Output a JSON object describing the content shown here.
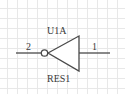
{
  "schematic": {
    "component": {
      "designator": "U1A",
      "value": "RES1",
      "type": "inverter",
      "input_pin": "2",
      "output_pin": "1"
    },
    "colors": {
      "wire": "#4a4a4a",
      "grid": "#e6e6e6",
      "text": "#3a3a3a",
      "background": "#ffffff"
    }
  }
}
